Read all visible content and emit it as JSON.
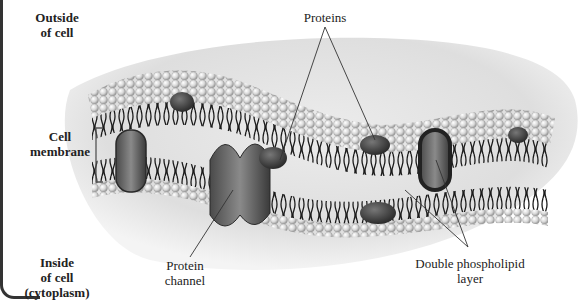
{
  "diagram": {
    "labels": {
      "outside": [
        "Outside",
        "of cell"
      ],
      "membrane": [
        "Cell",
        "membrane"
      ],
      "inside": [
        "Inside",
        "of cell",
        "(cytoplasm)"
      ],
      "proteins": "Proteins",
      "protein_channel": [
        "Protein",
        "channel"
      ],
      "phospholipid": [
        "Double phospholipid",
        "layer"
      ]
    },
    "colors": {
      "background_blob": "#e2e2e2",
      "phospholipid_head": "#e8e8e8",
      "phospholipid_tail": "#1a1a1a",
      "protein_dark": "#3a3a3a",
      "protein_mid": "#6e6e6e",
      "leader_line": "#333333"
    }
  }
}
